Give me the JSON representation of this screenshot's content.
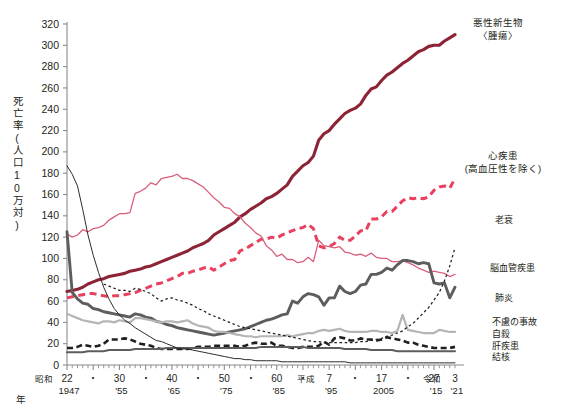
{
  "axis": {
    "y_title": "死亡率(人口10万対)",
    "y_ticks": [
      0,
      20,
      40,
      60,
      80,
      100,
      120,
      140,
      160,
      180,
      200,
      220,
      240,
      260,
      280,
      300,
      320
    ],
    "y_min": 0,
    "y_max": 320,
    "x_year_label": "年",
    "x_min": 1947,
    "x_max": 2021,
    "x_ticks": [
      {
        "era": "昭和",
        "jp": "22",
        "west": "1947"
      },
      {
        "era": "",
        "jp": "・",
        "west": ""
      },
      {
        "era": "",
        "jp": "30",
        "west": "'55"
      },
      {
        "era": "",
        "jp": "・",
        "west": ""
      },
      {
        "era": "",
        "jp": "40",
        "west": "'65"
      },
      {
        "era": "",
        "jp": "・",
        "west": ""
      },
      {
        "era": "",
        "jp": "50",
        "west": "'75"
      },
      {
        "era": "",
        "jp": "・",
        "west": ""
      },
      {
        "era": "",
        "jp": "60",
        "west": "'85"
      },
      {
        "era": "",
        "jp": "・",
        "west": ""
      },
      {
        "era": "平成",
        "jp": "7",
        "west": "'95"
      },
      {
        "era": "",
        "jp": "・",
        "west": ""
      },
      {
        "era": "",
        "jp": "17",
        "west": "2005"
      },
      {
        "era": "",
        "jp": "・",
        "west": ""
      },
      {
        "era": "",
        "jp": "27",
        "west": "'15"
      },
      {
        "era": "令和",
        "jp": "3",
        "west": "'21"
      }
    ]
  },
  "legend": [
    {
      "id": "cancer",
      "label": "悪性新生物",
      "label2": "〈腫瘍〉",
      "color": "#8c2436"
    },
    {
      "id": "heart",
      "label": "心疾患",
      "label2": "(高血圧性を除く)",
      "color": "#e8415f"
    },
    {
      "id": "senility",
      "label": "老衰",
      "label2": "",
      "color": "#231f20"
    },
    {
      "id": "cerebro",
      "label": "脳血管疾患",
      "label2": "",
      "color": "#d9607a"
    },
    {
      "id": "pneumonia",
      "label": "肺炎",
      "label2": "",
      "color": "#5d5d5d"
    },
    {
      "id": "accident",
      "label": "不慮の事故",
      "label2": "",
      "color": "#b5b5b5"
    },
    {
      "id": "suicide",
      "label": "自殺",
      "label2": "",
      "color": "#231f20"
    },
    {
      "id": "liver",
      "label": "肝疾患",
      "label2": "",
      "color": "#5d5d5d"
    },
    {
      "id": "tb",
      "label": "結核",
      "label2": "",
      "color": "#231f20"
    }
  ],
  "chart_data": {
    "type": "line",
    "title": "",
    "xlabel": "年",
    "ylabel": "死亡率(人口10万対)",
    "xlim": [
      1947,
      2021
    ],
    "ylim": [
      0,
      320
    ],
    "grid": false,
    "legend_position": "right-inline",
    "x": [
      1947,
      1948,
      1949,
      1950,
      1951,
      1952,
      1953,
      1954,
      1955,
      1956,
      1957,
      1958,
      1959,
      1960,
      1961,
      1962,
      1963,
      1964,
      1965,
      1966,
      1967,
      1968,
      1969,
      1970,
      1971,
      1972,
      1973,
      1974,
      1975,
      1976,
      1977,
      1978,
      1979,
      1980,
      1981,
      1982,
      1983,
      1984,
      1985,
      1986,
      1987,
      1988,
      1989,
      1990,
      1991,
      1992,
      1993,
      1994,
      1995,
      1996,
      1997,
      1998,
      1999,
      2000,
      2001,
      2002,
      2003,
      2004,
      2005,
      2006,
      2007,
      2008,
      2009,
      2010,
      2011,
      2012,
      2013,
      2014,
      2015,
      2016,
      2017,
      2018,
      2019,
      2020,
      2021
    ],
    "series": [
      {
        "name": "悪性新生物〈腫瘍〉",
        "color": "#8c2436",
        "style": "solid-thick",
        "values": [
          69,
          70,
          71,
          73,
          76,
          78,
          80,
          81,
          83,
          84,
          85,
          86,
          88,
          89,
          90,
          92,
          93,
          95,
          97,
          99,
          101,
          103,
          105,
          107,
          110,
          112,
          114,
          117,
          122,
          125,
          128,
          131,
          134,
          139,
          142,
          146,
          149,
          152,
          156,
          158,
          161,
          165,
          169,
          177,
          182,
          187,
          190,
          196,
          211,
          217,
          220,
          226,
          231,
          236,
          239,
          241,
          245,
          253,
          259,
          261,
          267,
          272,
          275,
          279,
          283,
          286,
          290,
          294,
          296,
          299,
          300,
          300,
          304,
          307,
          310
        ]
      },
      {
        "name": "心疾患(高血圧性を除く)",
        "color": "#e8415f",
        "style": "dashed-thick",
        "values": [
          63,
          64,
          65,
          66,
          67,
          67,
          66,
          65,
          64,
          65,
          65,
          66,
          67,
          68,
          70,
          72,
          74,
          76,
          77,
          79,
          81,
          83,
          86,
          86,
          88,
          89,
          91,
          92,
          89,
          92,
          95,
          98,
          99,
          107,
          109,
          112,
          115,
          118,
          118,
          120,
          119,
          122,
          124,
          126,
          128,
          129,
          132,
          128,
          112,
          110,
          111,
          114,
          120,
          117,
          117,
          121,
          126,
          126,
          137,
          137,
          139,
          144,
          144,
          149,
          154,
          157,
          156,
          157,
          156,
          158,
          164,
          167,
          168,
          166,
          175
        ]
      },
      {
        "name": "脳血管疾患",
        "color": "#d9607a",
        "style": "solid-thin",
        "values": [
          123,
          120,
          122,
          127,
          125,
          128,
          129,
          131,
          136,
          139,
          142,
          142,
          143,
          161,
          163,
          166,
          171,
          169,
          175,
          176,
          177,
          179,
          175,
          175,
          173,
          170,
          167,
          162,
          157,
          153,
          148,
          147,
          142,
          139,
          133,
          129,
          124,
          121,
          112,
          108,
          102,
          104,
          99,
          99,
          96,
          97,
          101,
          97,
          117,
          112,
          111,
          110,
          111,
          106,
          105,
          103,
          104,
          102,
          105,
          101,
          100,
          100,
          97,
          97,
          98,
          96,
          94,
          91,
          89,
          87,
          88,
          87,
          86,
          83,
          85
        ]
      },
      {
        "name": "肺炎",
        "color": "#5d5d5d",
        "style": "solid-thick-grey",
        "values": [
          125,
          68,
          62,
          58,
          57,
          53,
          52,
          50,
          49,
          48,
          47,
          46,
          45,
          48,
          47,
          45,
          44,
          41,
          40,
          38,
          37,
          35,
          34,
          33,
          32,
          31,
          30,
          29,
          28,
          29,
          30,
          31,
          32,
          33,
          34,
          36,
          38,
          40,
          42,
          43,
          45,
          47,
          48,
          60,
          58,
          64,
          67,
          66,
          64,
          56,
          63,
          63,
          74,
          69,
          67,
          69,
          75,
          76,
          85,
          85,
          87,
          91,
          89,
          94,
          98,
          98,
          97,
          95,
          96,
          95,
          77,
          76,
          77,
          63,
          73
        ]
      },
      {
        "name": "不慮の事故",
        "color": "#b5b5b5",
        "style": "solid-thin-grey",
        "values": [
          48,
          46,
          44,
          42,
          41,
          40,
          39,
          41,
          41,
          40,
          42,
          41,
          40,
          44,
          44,
          43,
          42,
          41,
          40,
          41,
          41,
          40,
          41,
          42,
          39,
          37,
          36,
          35,
          32,
          31,
          31,
          30,
          29,
          28,
          27,
          27,
          26,
          27,
          27,
          27,
          27,
          27,
          28,
          27,
          28,
          29,
          30,
          30,
          32,
          33,
          32,
          33,
          34,
          32,
          31,
          31,
          31,
          31,
          32,
          32,
          31,
          31,
          30,
          32,
          47,
          33,
          32,
          31,
          30,
          30,
          30,
          33,
          32,
          31,
          31
        ]
      },
      {
        "name": "自殺",
        "color": "#231f20",
        "style": "dashed-black",
        "values": [
          16,
          16,
          17,
          19,
          18,
          17,
          18,
          20,
          24,
          24,
          24,
          25,
          24,
          22,
          20,
          19,
          18,
          16,
          15,
          15,
          15,
          15,
          15,
          15,
          16,
          17,
          17,
          17,
          18,
          18,
          18,
          18,
          18,
          17,
          18,
          20,
          21,
          20,
          20,
          21,
          18,
          18,
          17,
          16,
          16,
          17,
          17,
          17,
          18,
          22,
          19,
          25,
          26,
          25,
          23,
          23,
          25,
          24,
          24,
          23,
          24,
          26,
          25,
          24,
          23,
          21,
          21,
          19,
          18,
          17,
          16,
          16,
          16,
          16,
          17
        ]
      },
      {
        "name": "肝疾患",
        "color": "#5d5d5d",
        "style": "solid-dark-thin",
        "values": [
          12,
          12,
          12,
          12,
          13,
          13,
          13,
          13,
          14,
          14,
          14,
          14,
          14,
          15,
          15,
          15,
          15,
          15,
          15,
          16,
          16,
          16,
          16,
          16,
          16,
          16,
          16,
          16,
          16,
          16,
          16,
          16,
          16,
          16,
          16,
          16,
          16,
          17,
          17,
          17,
          17,
          17,
          17,
          17,
          17,
          17,
          16,
          16,
          16,
          16,
          16,
          16,
          16,
          15,
          15,
          15,
          15,
          15,
          14,
          14,
          14,
          14,
          14,
          13,
          13,
          13,
          13,
          13,
          13,
          13,
          13,
          13,
          13,
          13,
          13
        ]
      },
      {
        "name": "結核",
        "color": "#231f20",
        "style": "solid-hairline",
        "values": [
          187,
          179,
          168,
          146,
          122,
          103,
          87,
          73,
          62,
          53,
          47,
          42,
          39,
          35,
          32,
          29,
          26,
          23,
          22,
          20,
          18,
          16,
          15,
          15,
          14,
          13,
          12,
          11,
          10,
          9,
          8,
          7,
          6,
          6,
          5,
          5,
          4,
          4,
          4,
          4,
          4,
          3,
          3,
          3,
          3,
          3,
          3,
          3,
          3,
          3,
          3,
          3,
          3,
          3,
          2,
          2,
          2,
          2,
          2,
          2,
          2,
          2,
          2,
          2,
          2,
          2,
          2,
          2,
          2,
          2,
          2,
          2,
          2,
          2,
          2
        ]
      },
      {
        "name": "老衰",
        "color": "#231f20",
        "style": "dotted-black",
        "values": [
          null,
          null,
          null,
          null,
          null,
          null,
          null,
          76,
          74,
          72,
          70,
          70,
          69,
          72,
          71,
          69,
          67,
          63,
          60,
          62,
          63,
          61,
          60,
          58,
          56,
          53,
          51,
          48,
          46,
          44,
          42,
          40,
          38,
          36,
          35,
          34,
          33,
          32,
          31,
          30,
          29,
          28,
          27,
          26,
          25,
          24,
          23,
          22,
          22,
          21,
          21,
          21,
          21,
          21,
          21,
          21,
          22,
          22,
          23,
          24,
          25,
          27,
          28,
          30,
          32,
          36,
          39,
          44,
          49,
          54,
          61,
          68,
          79,
          93,
          110
        ]
      }
    ]
  }
}
